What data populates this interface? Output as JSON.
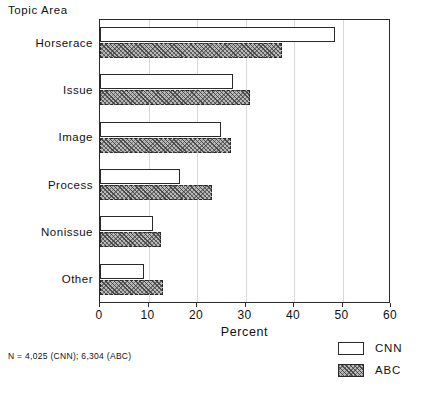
{
  "chart_data": {
    "type": "bar",
    "orientation": "horizontal",
    "title": "",
    "xlabel": "Percent",
    "ylabel": "Topic Area",
    "xlim": [
      0,
      60
    ],
    "xticks": [
      0,
      10,
      20,
      30,
      40,
      50,
      60
    ],
    "xtick_labels": [
      "0",
      "10",
      "20",
      "30",
      "40",
      "50",
      "60"
    ],
    "grid": true,
    "grid_axis": "x",
    "legend_position": "bottom-right",
    "categories": [
      "Horserace",
      "Issue",
      "Image",
      "Process",
      "Nonissue",
      "Other"
    ],
    "series": [
      {
        "name": "CNN",
        "fill": "white",
        "values": [
          48.5,
          27.5,
          25.0,
          16.5,
          11.0,
          9.0
        ]
      },
      {
        "name": "ABC",
        "fill": "hatched-gray",
        "values": [
          37.5,
          31.0,
          27.0,
          23.0,
          12.5,
          13.0
        ]
      }
    ],
    "footnote": "N = 4,025 (CNN); 6,304 (ABC)"
  },
  "axis_title": {
    "y": "Topic Area",
    "x": "Percent"
  },
  "legend": {
    "items": [
      {
        "label": "CNN",
        "swatch": "white-square-icon"
      },
      {
        "label": "ABC",
        "swatch": "hatched-square-icon"
      }
    ]
  },
  "footnote": {
    "text": "N = 4,025 (CNN); 6,304 (ABC)"
  },
  "caption": {
    "text": ""
  },
  "colors": {
    "axis": "#2a2a2a",
    "grid": "#d8d8d8",
    "cnn_fill": "#ffffff",
    "abc_fill": "#b9b9b9",
    "text": "#111111"
  }
}
